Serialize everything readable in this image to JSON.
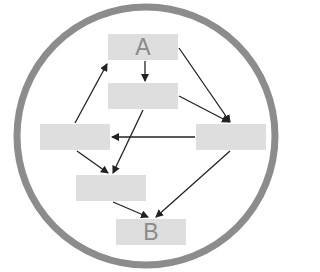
{
  "diagram": {
    "type": "flow",
    "container": {
      "shape": "circle",
      "ring_color": "#8c8c8c"
    },
    "node_color": "#dedede",
    "label_color": "#8a8a8a",
    "edge_color": "#222222",
    "nodes": [
      {
        "id": "A",
        "label": "A"
      },
      {
        "id": "n2",
        "label": ""
      },
      {
        "id": "n3",
        "label": ""
      },
      {
        "id": "n4",
        "label": ""
      },
      {
        "id": "n5",
        "label": ""
      },
      {
        "id": "B",
        "label": "B"
      }
    ],
    "edges": [
      {
        "from": "A",
        "to": "n2"
      },
      {
        "from": "A",
        "to": "n4"
      },
      {
        "from": "n2",
        "to": "n4"
      },
      {
        "from": "n2",
        "to": "n5"
      },
      {
        "from": "n3",
        "to": "A"
      },
      {
        "from": "n3",
        "to": "n5"
      },
      {
        "from": "n4",
        "to": "n3"
      },
      {
        "from": "n4",
        "to": "B"
      },
      {
        "from": "n5",
        "to": "B"
      }
    ]
  }
}
